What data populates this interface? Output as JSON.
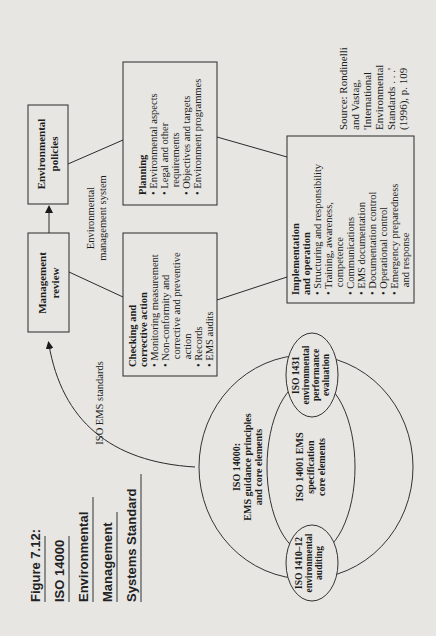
{
  "figure": {
    "title_lines": [
      "Figure 7.12:",
      "ISO 14000",
      "Environmental",
      "Management",
      "Systems Standard"
    ],
    "source_lines": [
      "Source: Rondinelli",
      "and Vastag,",
      "'International",
      "Environmental",
      "Standards . . .'",
      "(1996), p. 109"
    ]
  },
  "boxes": {
    "environmental_policies": {
      "lines": [
        "Environmental",
        "policies"
      ]
    },
    "management_review": {
      "lines": [
        "Management",
        "review"
      ]
    },
    "planning": {
      "heading": "Planning",
      "lines": [
        "• Environmental aspects",
        "• Legal and other",
        "   requirements",
        "• Objectives and targets",
        "• Environment programmes"
      ]
    },
    "checking": {
      "heading_lines": [
        "Checking and",
        "corrective action"
      ],
      "lines": [
        "• Monitoring measurement",
        "• Non-conformity and",
        "   corrective and preventive",
        "   action",
        "• Records",
        "• EMS audits"
      ]
    },
    "implementation": {
      "heading_lines": [
        "Implementation",
        "and operation"
      ],
      "lines": [
        "• Structuring and responsibility",
        "• Training, awareness,",
        "   competence",
        "• Communications",
        "• EMS documentation",
        "• Documentation control",
        "• Operational control",
        "• Emergency preparedness",
        "   and response"
      ]
    }
  },
  "labels": {
    "ems_label": [
      "Environmental",
      "management system"
    ],
    "iso_ems_standards": "ISO EMS standards"
  },
  "circles": {
    "outer": [
      "ISO 14000:",
      "EMS guidance principles",
      "and core elements"
    ],
    "inner": [
      "ISO 14001 EMS",
      "specification",
      "core elements"
    ],
    "performance": [
      "ISO 1431",
      "environmental",
      "performance",
      "evaluation"
    ],
    "auditing": [
      "ISO 1410–12",
      "environmental",
      "auditing"
    ]
  }
}
